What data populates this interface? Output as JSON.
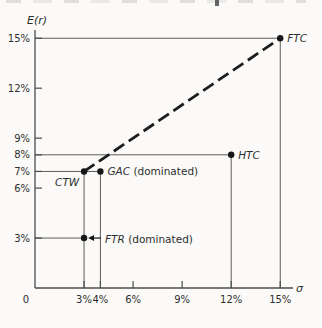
{
  "page": {
    "background": "#fbfaf8"
  },
  "chart_data": {
    "type": "scatter",
    "title": "",
    "xlabel": "σ",
    "ylabel": "E(r)",
    "xlim": [
      0,
      15.8
    ],
    "ylim": [
      0,
      15.6
    ],
    "grid": false,
    "legend": "none",
    "x_ticks": [
      {
        "value": 0,
        "label": "0",
        "tick_mark": false
      },
      {
        "value": 3,
        "label": "3%",
        "tick_mark": true
      },
      {
        "value": 4,
        "label": "4%",
        "tick_mark": true
      },
      {
        "value": 6,
        "label": "6%",
        "tick_mark": true
      },
      {
        "value": 9,
        "label": "9%",
        "tick_mark": true
      },
      {
        "value": 12,
        "label": "12%",
        "tick_mark": true
      },
      {
        "value": 15,
        "label": "15%",
        "tick_mark": true
      }
    ],
    "y_ticks": [
      {
        "value": 3,
        "label": "3%"
      },
      {
        "value": 6,
        "label": "6%"
      },
      {
        "value": 7,
        "label": "7%"
      },
      {
        "value": 8,
        "label": "8%"
      },
      {
        "value": 9,
        "label": "9%"
      },
      {
        "value": 12,
        "label": "12%"
      },
      {
        "value": 15,
        "label": "15%"
      }
    ],
    "points": [
      {
        "name": "FTC",
        "x": 15,
        "y": 15,
        "label": "FTC",
        "label_note": "",
        "label_placement": "right"
      },
      {
        "name": "HTC",
        "x": 12,
        "y": 8,
        "label": "HTC",
        "label_note": "",
        "label_placement": "right"
      },
      {
        "name": "GAC",
        "x": 4,
        "y": 7,
        "label": "GAC",
        "label_note": " (dominated)",
        "label_placement": "right"
      },
      {
        "name": "CTW",
        "x": 3,
        "y": 7,
        "label": "CTW",
        "label_note": "",
        "label_placement": "below-left"
      },
      {
        "name": "FTR",
        "x": 3,
        "y": 3,
        "label": "FTR",
        "label_note": " (dominated)",
        "label_placement": "arrow-right"
      }
    ],
    "reference_lines": {
      "horizontal": [
        {
          "y": 15,
          "x_from": 0,
          "x_to": 15
        },
        {
          "y": 8,
          "x_from": 0,
          "x_to": 12
        },
        {
          "y": 7,
          "x_from": 0,
          "x_to": 4
        },
        {
          "y": 3,
          "x_from": 0,
          "x_to": 3
        }
      ],
      "vertical": [
        {
          "x": 15,
          "y_from": 0,
          "y_to": 15
        },
        {
          "x": 12,
          "y_from": 0,
          "y_to": 8
        },
        {
          "x": 4,
          "y_from": 0,
          "y_to": 7
        },
        {
          "x": 3,
          "y_from": 0,
          "y_to": 7
        }
      ]
    },
    "dashed_line": {
      "from": {
        "x": 3,
        "y": 7
      },
      "to": {
        "x": 15,
        "y": 15
      }
    }
  },
  "colors": {
    "axis": "#4d4d4d",
    "reference_line": "#5c5c5c",
    "dashed_line": "#1d1d1d",
    "point": "#161616",
    "text": "#2e2e2e"
  }
}
